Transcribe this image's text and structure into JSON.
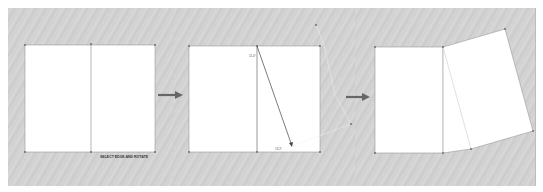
{
  "diagram": {
    "panels": [
      {
        "id": "step-1",
        "caption": "SELECT EDGE AND ROTATE",
        "description": "Rectangle split into two faces by a vertical center line"
      },
      {
        "id": "step-2",
        "caption": "",
        "description": "Rotation guide drawn from top of center line to lower right",
        "dimension_labels": [
          "11.4°",
          "13.2°"
        ]
      },
      {
        "id": "step-3",
        "caption": "",
        "description": "Right face rotated/folded outward"
      }
    ],
    "arrows": [
      {
        "from": "step-1",
        "to": "step-2",
        "icon": "right-arrow-icon"
      },
      {
        "from": "step-2",
        "to": "step-3",
        "icon": "right-arrow-icon"
      }
    ],
    "colors": {
      "background": "#d2d2d2",
      "face": "#ffffff",
      "edge": "#777777",
      "arrow": "#666666"
    }
  }
}
